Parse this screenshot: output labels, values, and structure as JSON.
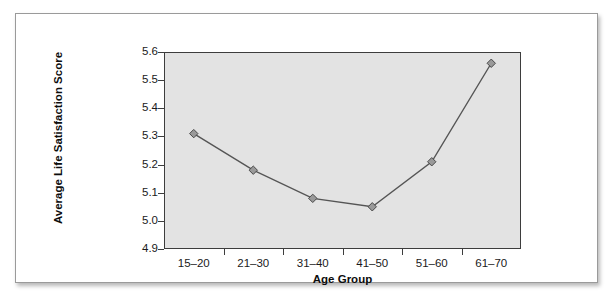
{
  "chart_data": {
    "type": "line",
    "title": "",
    "xlabel": "Age Group",
    "ylabel": "Average Life Satisfaction Score",
    "categories": [
      "15–20",
      "21–30",
      "31–40",
      "41–50",
      "51–60",
      "61–70"
    ],
    "values": [
      5.31,
      5.18,
      5.08,
      5.05,
      5.21,
      5.56
    ],
    "series": [
      {
        "name": "Average Life Satisfaction Score",
        "values": [
          5.31,
          5.18,
          5.08,
          5.05,
          5.21,
          5.56
        ]
      }
    ],
    "ylim": [
      4.9,
      5.6
    ],
    "y_ticks": [
      "4.9",
      "5.0",
      "5.1",
      "5.2",
      "5.3",
      "5.4",
      "5.5",
      "5.6"
    ],
    "y_tick_values": [
      4.9,
      5.0,
      5.1,
      5.2,
      5.3,
      5.4,
      5.5,
      5.6
    ],
    "grid": false,
    "legend": false,
    "legend_position": "none",
    "marker": "diamond",
    "colors": {
      "line": "#555555",
      "marker_fill": "#9a9a9a",
      "marker_edge": "#4a4a4a",
      "plot_background": "#e3e3e3",
      "frame": "#3d3d3d",
      "card_background": "#ffffff",
      "text": "#1a1a1a"
    }
  }
}
